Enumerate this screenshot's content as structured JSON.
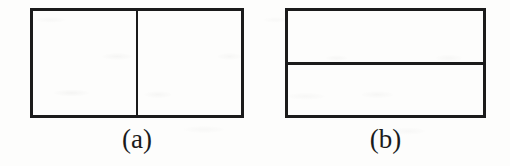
{
  "figure": {
    "background_color": "#fdfdfc",
    "ink_color": "#1b1b1b",
    "panels": [
      {
        "id": "a",
        "caption": "(a)",
        "shape": "rectangle",
        "split": "vertical",
        "parts": 2,
        "outer_border_px": 3,
        "divider_px": 2,
        "bounds": {
          "x": 30,
          "y": 8,
          "width": 214,
          "height": 110
        },
        "divider_position": {
          "x": 136,
          "y": 8
        }
      },
      {
        "id": "b",
        "caption": "(b)",
        "shape": "rectangle",
        "split": "horizontal",
        "parts": 2,
        "outer_border_px": 3,
        "divider_px": 3,
        "bounds": {
          "x": 285,
          "y": 8,
          "width": 201,
          "height": 110
        },
        "divider_position": {
          "x": 285,
          "y": 62
        }
      }
    ]
  }
}
